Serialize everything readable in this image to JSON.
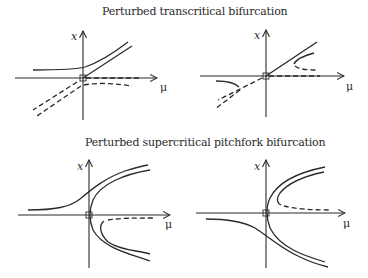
{
  "titles": {
    "top": "Perturbed transcritical bifurcation",
    "bottom": "Perturbed supercritical pitchfork bifurcation"
  },
  "axes": {
    "x_label": "x",
    "mu_label": "μ"
  },
  "panels": [
    {
      "id": "transcritical-left",
      "group": "Perturbed transcritical bifurcation",
      "position": "top-left"
    },
    {
      "id": "transcritical-right",
      "group": "Perturbed transcritical bifurcation",
      "position": "top-right"
    },
    {
      "id": "pitchfork-left",
      "group": "Perturbed supercritical pitchfork bifurcation",
      "position": "bottom-left"
    },
    {
      "id": "pitchfork-right",
      "group": "Perturbed supercritical pitchfork bifurcation",
      "position": "bottom-right"
    }
  ],
  "legend_conventions": {
    "solid": "stable branch",
    "dashed": "unstable branch"
  },
  "colors": {
    "ink": "#2a2a2a",
    "background": "#ffffff"
  }
}
